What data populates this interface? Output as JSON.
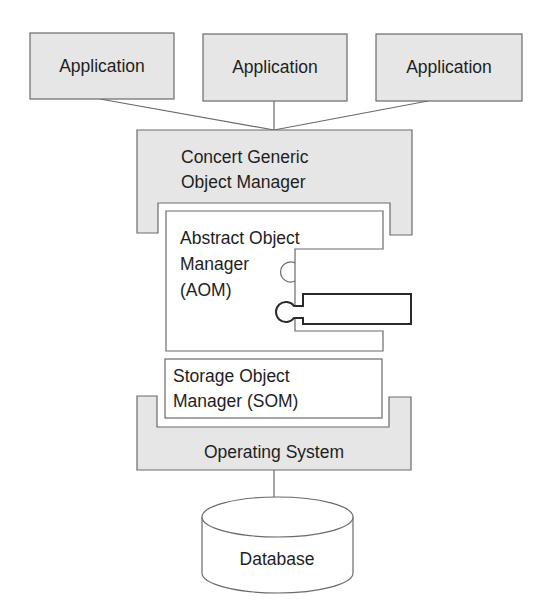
{
  "diagram": {
    "applications": [
      {
        "label": "Application"
      },
      {
        "label": "Application"
      },
      {
        "label": "Application"
      }
    ],
    "concert": {
      "line1": "Concert Generic",
      "line2": "Object Manager"
    },
    "aom": {
      "line1": "Abstract Object",
      "line2": "Manager",
      "line3": "(AOM)"
    },
    "som": {
      "line1": "Storage Object",
      "line2": "Manager (SOM)"
    },
    "os": {
      "label": "Operating System"
    },
    "database": {
      "label": "Database"
    },
    "colors": {
      "box_fill": "#e6e6e6",
      "stroke": "#6a6a6a",
      "text": "#1e1e1e"
    }
  }
}
